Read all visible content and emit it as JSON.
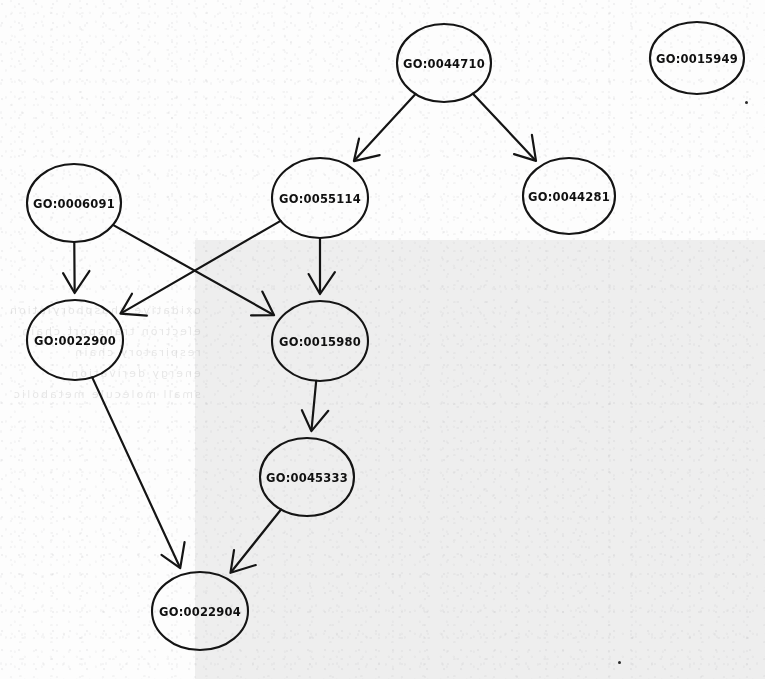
{
  "canvas": {
    "width": 765,
    "height": 679,
    "background": "#fdfdfd"
  },
  "shaded_region": {
    "x": 195,
    "y": 240,
    "width": 570,
    "height": 439,
    "color": "#f0f0f0"
  },
  "ghost_text": "oxidative phosphorylation\nelectron transport chain\nrespiratory chain\nenergy derivation\nsmall molecule metabolic",
  "graph": {
    "type": "directed-acyclic-graph",
    "node_shape": "ellipse",
    "node_stroke_color": "#141414",
    "node_fill_color": "none",
    "label_color": "#101010",
    "edge_color": "#141414",
    "nodes": [
      {
        "id": "GO:0044710",
        "label": "GO:0044710",
        "cx": 444,
        "cy": 63,
        "rx": 47,
        "ry": 39
      },
      {
        "id": "GO:0015949",
        "label": "GO:0015949",
        "cx": 697,
        "cy": 58,
        "rx": 47,
        "ry": 36
      },
      {
        "id": "GO:0006091",
        "label": "GO:0006091",
        "cx": 74,
        "cy": 203,
        "rx": 47,
        "ry": 39
      },
      {
        "id": "GO:0055114",
        "label": "GO:0055114",
        "cx": 320,
        "cy": 198,
        "rx": 48,
        "ry": 40
      },
      {
        "id": "GO:0044281",
        "label": "GO:0044281",
        "cx": 569,
        "cy": 196,
        "rx": 46,
        "ry": 38
      },
      {
        "id": "GO:0022900",
        "label": "GO:0022900",
        "cx": 75,
        "cy": 340,
        "rx": 48,
        "ry": 40
      },
      {
        "id": "GO:0015980",
        "label": "GO:0015980",
        "cx": 320,
        "cy": 341,
        "rx": 48,
        "ry": 40
      },
      {
        "id": "GO:0045333",
        "label": "GO:0045333",
        "cx": 307,
        "cy": 477,
        "rx": 47,
        "ry": 39
      },
      {
        "id": "GO:0022904",
        "label": "GO:0022904",
        "cx": 200,
        "cy": 611,
        "rx": 48,
        "ry": 39
      }
    ],
    "edges": [
      {
        "from": "GO:0044710",
        "to": "GO:0055114"
      },
      {
        "from": "GO:0044710",
        "to": "GO:0044281"
      },
      {
        "from": "GO:0006091",
        "to": "GO:0022900"
      },
      {
        "from": "GO:0006091",
        "to": "GO:0015980"
      },
      {
        "from": "GO:0055114",
        "to": "GO:0015980"
      },
      {
        "from": "GO:0055114",
        "to": "GO:0022900"
      },
      {
        "from": "GO:0015980",
        "to": "GO:0045333"
      },
      {
        "from": "GO:0022900",
        "to": "GO:0022904"
      },
      {
        "from": "GO:0045333",
        "to": "GO:0022904"
      }
    ],
    "isolated_nodes": [
      "GO:0015949"
    ]
  },
  "specks": [
    {
      "x": 745,
      "y": 101,
      "size": 3
    },
    {
      "x": 618,
      "y": 661,
      "size": 3
    }
  ]
}
